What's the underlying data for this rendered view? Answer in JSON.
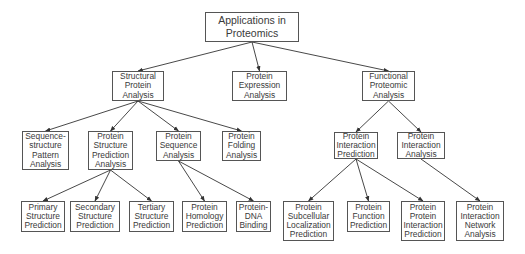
{
  "diagram": {
    "title": "Applications in Proteomics",
    "colors": {
      "line": "#333333",
      "border": "#555555",
      "text": "#3a3a3a",
      "background": "#ffffff"
    },
    "nodes": {
      "root": {
        "label": "Applications in\nProteomics",
        "x": 205,
        "y": 12,
        "w": 94,
        "h": 30
      },
      "spa": {
        "label": "Structural\nProtein\nAnalysis",
        "x": 112,
        "y": 71,
        "w": 52,
        "h": 30
      },
      "pea": {
        "label": "Protein\nExpression\nAnalysis",
        "x": 232,
        "y": 71,
        "w": 55,
        "h": 30
      },
      "fpa": {
        "label": "Functional\nProteomic\nAnalysis",
        "x": 362,
        "y": 71,
        "w": 53,
        "h": 30
      },
      "sspa": {
        "label": "Sequence-\nstructure\nPattern\nAnalysis",
        "x": 22,
        "y": 131,
        "w": 47,
        "h": 39
      },
      "pspa": {
        "label": "Protein\nStructure\nPrediction\nAnalysis",
        "x": 88,
        "y": 131,
        "w": 45,
        "h": 39
      },
      "psa": {
        "label": "Protein\nSequence\nAnalysis",
        "x": 156,
        "y": 131,
        "w": 45,
        "h": 30
      },
      "pfa": {
        "label": "Protein\nFolding\nAnalysis",
        "x": 222,
        "y": 131,
        "w": 39,
        "h": 30
      },
      "pip": {
        "label": "Protein\nInteraction\nPrediction",
        "x": 334,
        "y": 132,
        "w": 44,
        "h": 27
      },
      "pia": {
        "label": "Protein\nInteraction\nAnalysis",
        "x": 397,
        "y": 132,
        "w": 48,
        "h": 27
      },
      "psp1": {
        "label": "Primary\nStructure\nPrediction",
        "x": 21,
        "y": 201,
        "w": 44,
        "h": 31
      },
      "ssp": {
        "label": "Secondary\nStructure\nPrediction",
        "x": 70,
        "y": 201,
        "w": 50,
        "h": 31
      },
      "tsp": {
        "label": "Tertiary\nStructure\nPrediction",
        "x": 129,
        "y": 201,
        "w": 45,
        "h": 31
      },
      "php": {
        "label": "Protein\nHomology\nPrediction",
        "x": 182,
        "y": 201,
        "w": 45,
        "h": 31
      },
      "pdb": {
        "label": "Protein-\nDNA\nBinding",
        "x": 236,
        "y": 201,
        "w": 35,
        "h": 31
      },
      "pslp": {
        "label": "Protein\nSubcellular\nLocalization\nPrediction",
        "x": 283,
        "y": 201,
        "w": 51,
        "h": 40
      },
      "pfp": {
        "label": "Protein\nFunction\nPrediction",
        "x": 347,
        "y": 201,
        "w": 43,
        "h": 31
      },
      "ppip": {
        "label": "Protein\nProtein\nInteraction\nPrediction",
        "x": 401,
        "y": 201,
        "w": 44,
        "h": 40
      },
      "pina": {
        "label": "Protein\nInteraction\nNetwork\nAnalysis",
        "x": 456,
        "y": 201,
        "w": 48,
        "h": 40
      }
    },
    "edges": [
      [
        "root",
        "spa"
      ],
      [
        "root",
        "pea"
      ],
      [
        "root",
        "fpa"
      ],
      [
        "spa",
        "sspa"
      ],
      [
        "spa",
        "pspa"
      ],
      [
        "spa",
        "psa"
      ],
      [
        "spa",
        "pfa"
      ],
      [
        "fpa",
        "pip"
      ],
      [
        "fpa",
        "pia"
      ],
      [
        "pspa",
        "psp1"
      ],
      [
        "pspa",
        "ssp"
      ],
      [
        "pspa",
        "tsp"
      ],
      [
        "psa",
        "php"
      ],
      [
        "psa",
        "pdb"
      ],
      [
        "pip",
        "pslp"
      ],
      [
        "pip",
        "pfp"
      ],
      [
        "pip",
        "ppip"
      ],
      [
        "pia",
        "pina"
      ]
    ]
  }
}
